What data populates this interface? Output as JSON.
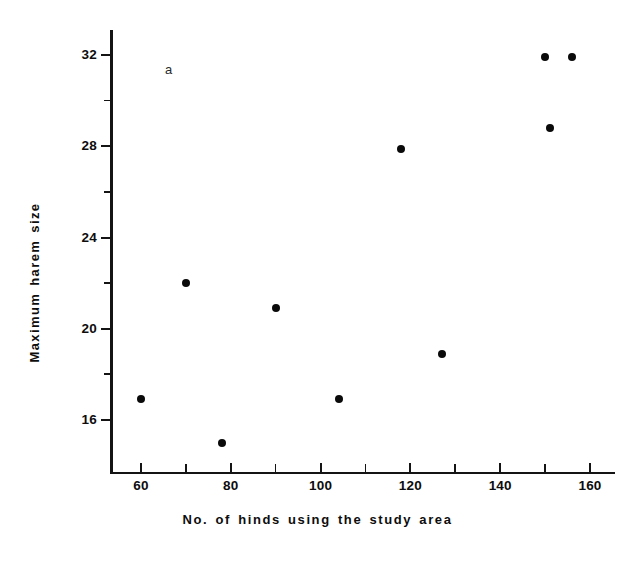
{
  "chart_data": {
    "type": "scatter",
    "title": "",
    "panel_label": "a",
    "xlabel": "No. of hinds using the study area",
    "ylabel": "Maximum harem size",
    "xlim": [
      52,
      165
    ],
    "ylim": [
      14.2,
      33.2
    ],
    "grid": false,
    "legend": null,
    "x_ticks": [
      {
        "value": 60,
        "label": "60",
        "minor": false
      },
      {
        "value": 70,
        "label": "",
        "minor": true
      },
      {
        "value": 80,
        "label": "80",
        "minor": false
      },
      {
        "value": 90,
        "label": "",
        "minor": true
      },
      {
        "value": 100,
        "label": "100",
        "minor": false
      },
      {
        "value": 110,
        "label": "",
        "minor": true
      },
      {
        "value": 120,
        "label": "120",
        "minor": false
      },
      {
        "value": 130,
        "label": "",
        "minor": true
      },
      {
        "value": 140,
        "label": "140",
        "minor": false
      },
      {
        "value": 150,
        "label": "",
        "minor": true
      },
      {
        "value": 160,
        "label": "160",
        "minor": false
      }
    ],
    "y_ticks": [
      {
        "value": 16,
        "label": "16",
        "minor": false
      },
      {
        "value": 18,
        "label": "",
        "minor": true
      },
      {
        "value": 20,
        "label": "20",
        "minor": false
      },
      {
        "value": 22,
        "label": "",
        "minor": true
      },
      {
        "value": 24,
        "label": "24",
        "minor": false
      },
      {
        "value": 26,
        "label": "",
        "minor": true
      },
      {
        "value": 28,
        "label": "28",
        "minor": false
      },
      {
        "value": 30,
        "label": "",
        "minor": true
      },
      {
        "value": 32,
        "label": "32",
        "minor": false
      }
    ],
    "points": [
      {
        "x": 60,
        "y": 16.9
      },
      {
        "x": 70,
        "y": 22.0
      },
      {
        "x": 78,
        "y": 15.0
      },
      {
        "x": 90,
        "y": 20.9
      },
      {
        "x": 104,
        "y": 16.9
      },
      {
        "x": 118,
        "y": 27.9
      },
      {
        "x": 127,
        "y": 18.9
      },
      {
        "x": 150,
        "y": 31.9
      },
      {
        "x": 151,
        "y": 28.8
      },
      {
        "x": 156,
        "y": 31.9
      }
    ],
    "marker": {
      "shape": "circle",
      "color": "#0a0a0a",
      "size": 8
    },
    "axis_color": "#141414"
  }
}
